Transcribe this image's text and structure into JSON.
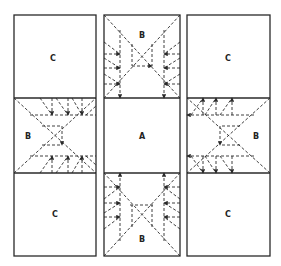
{
  "diagram": {
    "type": "quilt-pattern-layout",
    "columns": [
      {
        "id": "left",
        "panels": [
          {
            "label": "C",
            "pattern": "plain"
          },
          {
            "label": "B",
            "pattern": "dashed-x-folds",
            "orientation": "horizontal"
          },
          {
            "label": "C",
            "pattern": "plain"
          }
        ]
      },
      {
        "id": "middle",
        "panels": [
          {
            "label": "B",
            "pattern": "dashed-x-folds",
            "orientation": "vertical"
          },
          {
            "label": "A",
            "pattern": "plain"
          },
          {
            "label": "B",
            "pattern": "dashed-x-folds",
            "orientation": "vertical"
          }
        ]
      },
      {
        "id": "right",
        "panels": [
          {
            "label": "C",
            "pattern": "plain"
          },
          {
            "label": "B",
            "pattern": "dashed-x-folds",
            "orientation": "horizontal"
          },
          {
            "label": "C",
            "pattern": "plain"
          }
        ]
      }
    ],
    "colors": {
      "line": "#2a2a2a",
      "background": "#ffffff"
    }
  }
}
